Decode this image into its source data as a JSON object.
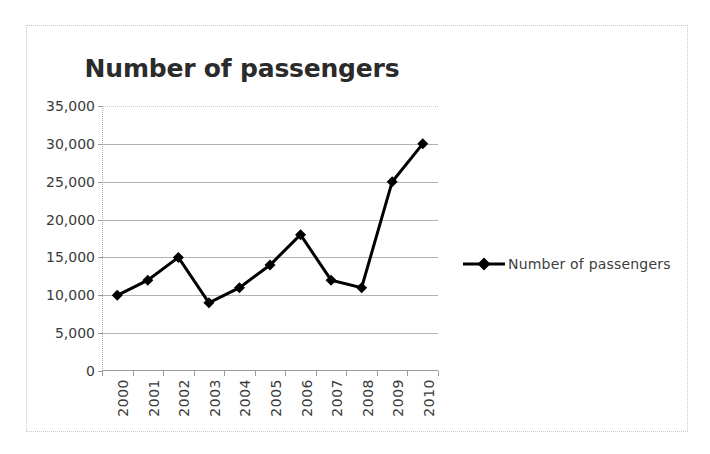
{
  "chart_data": {
    "type": "line",
    "title": "Number of passengers",
    "xlabel": "",
    "ylabel": "",
    "categories": [
      "2000",
      "2001",
      "2002",
      "2003",
      "2004",
      "2005",
      "2006",
      "2007",
      "2008",
      "2009",
      "2010"
    ],
    "series": [
      {
        "name": "Number of passengers",
        "values": [
          10000,
          12000,
          15000,
          9000,
          11000,
          14000,
          18000,
          12000,
          11000,
          25000,
          30000
        ],
        "color": "#000000",
        "marker": "diamond"
      }
    ],
    "ylim": [
      0,
      35000
    ],
    "ytick_labels": [
      "0",
      "5,000",
      "10,000",
      "15,000",
      "20,000",
      "25,000",
      "30,000",
      "35,000"
    ],
    "ytick_values": [
      0,
      5000,
      10000,
      15000,
      20000,
      25000,
      30000,
      35000
    ],
    "grid": true,
    "grid_color": "#b3b3b3",
    "legend_position": "right",
    "legend_entries": [
      "Number of passengers"
    ],
    "x_tick_label_rotation": 90,
    "plot_background": "#ffffff",
    "border_color": "#c9c9cf"
  }
}
